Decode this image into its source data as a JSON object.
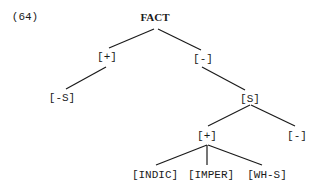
{
  "example_number": "(64)",
  "tree": {
    "root": "FACT",
    "nodes": {
      "plus_top": "[+]",
      "minus_top": "[-]",
      "minus_s": "[-S]",
      "s": "[S]",
      "plus_low": "[+]",
      "minus_low": "[-]",
      "indic": "[INDIC]",
      "imper": "[IMPER]",
      "wh_s": "[WH-S]"
    },
    "edges": [
      [
        "FACT",
        "[+]"
      ],
      [
        "FACT",
        "[-]"
      ],
      [
        "[+]",
        "[-S]"
      ],
      [
        "[-]",
        "[S]"
      ],
      [
        "[S]",
        "[+]"
      ],
      [
        "[S]",
        "[-]"
      ],
      [
        "[+]",
        "[INDIC]"
      ],
      [
        "[+]",
        "[IMPER]"
      ],
      [
        "[+]",
        "[WH-S]"
      ]
    ]
  }
}
